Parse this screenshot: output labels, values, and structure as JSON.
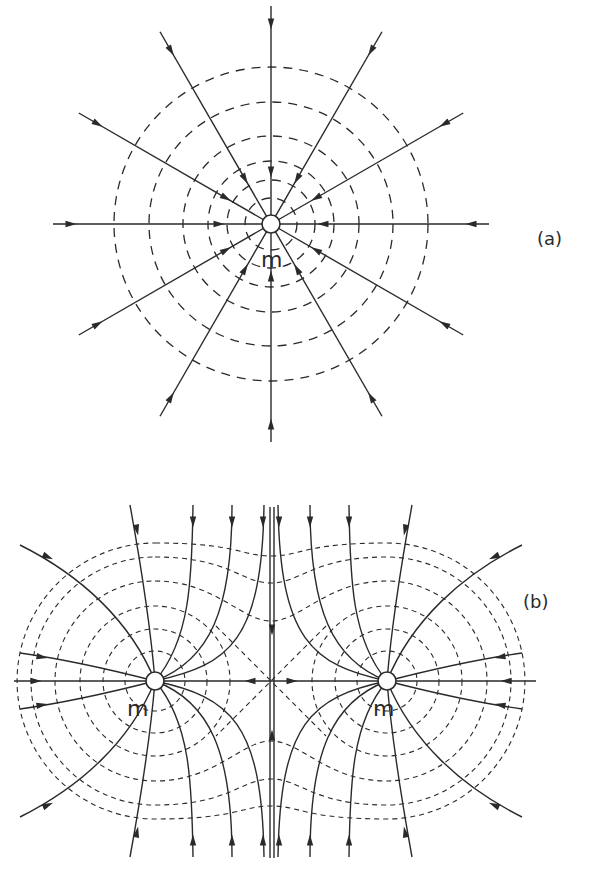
{
  "diagram_a": {
    "label": "(a)",
    "mass_label": "m",
    "description": "Gravitational field lines converging radially onto a single point mass m, with dashed circular equipotential surfaces",
    "field_line_count": 12,
    "equipotential_count": 6,
    "arrow_direction": "inward"
  },
  "diagram_b": {
    "label": "(b)",
    "mass_labels": [
      "m",
      "m"
    ],
    "description": "Field lines and dashed equipotentials for two equal point masses m; neutral point midway between them",
    "arrow_direction": "inward"
  },
  "colors": {
    "ink": "#2a2a2a",
    "background": "#ffffff"
  }
}
